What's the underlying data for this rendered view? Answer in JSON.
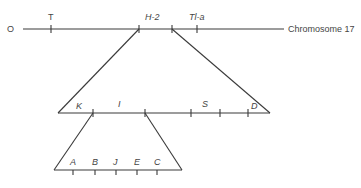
{
  "diagram": {
    "top_line": {
      "start_label": "O",
      "end_label": "Chromosome 17",
      "markers": [
        {
          "label": "T"
        },
        {
          "label": "H-2"
        },
        {
          "label": "Tl-a"
        }
      ]
    },
    "middle_line": {
      "markers": [
        {
          "label": "K"
        },
        {
          "label": "I"
        },
        {
          "label": "S"
        },
        {
          "label": "D"
        }
      ]
    },
    "bottom_line": {
      "markers": [
        {
          "label": "A"
        },
        {
          "label": "B"
        },
        {
          "label": "J"
        },
        {
          "label": "E"
        },
        {
          "label": "C"
        }
      ]
    }
  }
}
